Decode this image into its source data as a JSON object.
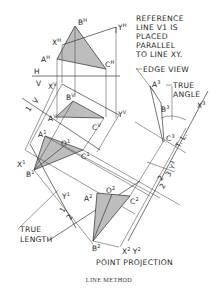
{
  "figure": {
    "caption": "LINE METHOD",
    "annotations": {
      "reference_note": [
        "REFERENCE",
        "LINE V1 IS",
        "PLACED",
        "PARALLEL",
        "TO LINE XY."
      ],
      "edge_view": "EDGE VIEW",
      "true_angle": [
        "TRUE",
        "ANGLE"
      ],
      "true_length": [
        "TRUE",
        "LENGTH"
      ],
      "point_projection": "POINT PROJECTION",
      "tl": "T. L."
    },
    "plane_labels": {
      "H": "H",
      "V": "V",
      "V_aux": "V",
      "one_aux": "1",
      "three_a": "3",
      "two_a": "2",
      "one_b": "1",
      "two_b": "2",
      "three_b": "3",
      "two_c": "2"
    },
    "points": {
      "BH": {
        "base": "B",
        "sup": "H"
      },
      "XH": {
        "base": "X",
        "sup": "H"
      },
      "AH": {
        "base": "A",
        "sup": "H"
      },
      "CH": {
        "base": "C",
        "sup": "H"
      },
      "YH": {
        "base": "Y",
        "sup": "H"
      },
      "XV": {
        "base": "X",
        "sup": "V"
      },
      "BV": {
        "base": "B",
        "sup": "V"
      },
      "AV": {
        "base": "A",
        "sup": "V"
      },
      "CV": {
        "base": "C",
        "sup": "V"
      },
      "YV": {
        "base": "Y",
        "sup": "V"
      },
      "X1": {
        "base": "X",
        "sup": "1"
      },
      "A1": {
        "base": "A",
        "sup": "1"
      },
      "O1": {
        "base": "O",
        "sup": "1"
      },
      "C1": {
        "base": "C",
        "sup": "1"
      },
      "B1": {
        "base": "B",
        "sup": "1"
      },
      "Y1": {
        "base": "Y",
        "sup": "1"
      },
      "A2": {
        "base": "A",
        "sup": "2"
      },
      "O2": {
        "base": "O",
        "sup": "2"
      },
      "C2": {
        "base": "C",
        "sup": "2"
      },
      "B2": {
        "base": "B",
        "sup": "2"
      },
      "X2Y2": {
        "base": "X",
        "sup": "2",
        "base2": "Y",
        "sup2": "2"
      },
      "A3": {
        "base": "A",
        "sup": "3"
      },
      "B3": {
        "base": "B",
        "sup": "3"
      },
      "C3": {
        "base": "C",
        "sup": "3"
      },
      "X3": {
        "base": "X",
        "sup": "3"
      },
      "Y3": {
        "base": "Y",
        "sup": "3"
      }
    },
    "colors": {
      "line": "#3a3a3a",
      "fill": "#bdbdbd",
      "background": "#ffffff"
    }
  }
}
